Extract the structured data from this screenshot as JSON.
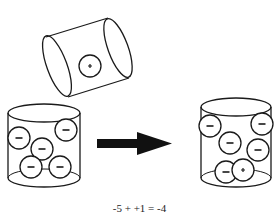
{
  "diagram": {
    "tilted_container": {
      "charges": [
        {
          "sign": "+",
          "cx": 90,
          "cy": 66
        }
      ]
    },
    "before_container": {
      "charges": [
        {
          "sign": "−",
          "cx": 19,
          "cy": 138
        },
        {
          "sign": "−",
          "cx": 66,
          "cy": 130
        },
        {
          "sign": "−",
          "cx": 42,
          "cy": 149
        },
        {
          "sign": "−",
          "cx": 31,
          "cy": 167
        },
        {
          "sign": "−",
          "cx": 60,
          "cy": 167
        }
      ]
    },
    "after_container": {
      "charges": [
        {
          "sign": "−",
          "cx": 210,
          "cy": 126
        },
        {
          "sign": "−",
          "cx": 262,
          "cy": 124
        },
        {
          "sign": "−",
          "cx": 230,
          "cy": 143
        },
        {
          "sign": "−",
          "cx": 258,
          "cy": 150
        },
        {
          "sign": "−",
          "cx": 226,
          "cy": 172
        },
        {
          "sign": "+",
          "cx": 243,
          "cy": 170
        }
      ]
    },
    "arrow": {
      "direction": "right",
      "color": "#111111"
    },
    "equation": "-5 + +1 = -4"
  },
  "colors": {
    "stroke": "#1a1a1a",
    "background": "#ffffff"
  }
}
